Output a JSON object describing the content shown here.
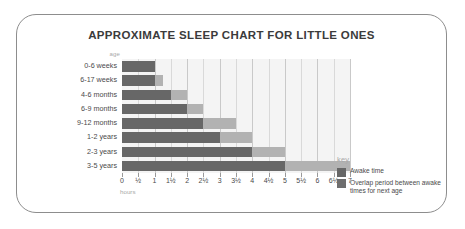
{
  "title": "APPROXIMATE SLEEP CHART FOR LITTLE ONES",
  "axis": {
    "y_title": "age",
    "x_title": "hours"
  },
  "legend": {
    "title": "key",
    "items": [
      {
        "label": "Awake time",
        "color": "#676767"
      },
      {
        "label": "Overlap period between awake times for next age",
        "color": "#6e6e6e"
      }
    ]
  },
  "chart_data": {
    "type": "bar",
    "orientation": "horizontal",
    "stacked": true,
    "title": "APPROXIMATE SLEEP CHART FOR LITTLE ONES",
    "xlabel": "hours",
    "ylabel": "age",
    "xlim": [
      0,
      7
    ],
    "grid": true,
    "legend_position": "right",
    "categories": [
      "0-6 weeks",
      "6-17 weeks",
      "4-6 months",
      "6-9 months",
      "9-12 months",
      "1-2 years",
      "2-3 years",
      "3-5 years"
    ],
    "tick_labels": [
      "0",
      "½",
      "1",
      "1½",
      "2",
      "2½",
      "3",
      "3½",
      "4",
      "4½",
      "5",
      "5½",
      "6",
      "6½",
      "7"
    ],
    "tick_values": [
      0,
      0.5,
      1,
      1.5,
      2,
      2.5,
      3,
      3.5,
      4,
      4.5,
      5,
      5.5,
      6,
      6.5,
      7
    ],
    "series": [
      {
        "name": "Awake time",
        "color": "#676767",
        "values": [
          1,
          1,
          1.5,
          2,
          2.5,
          3,
          4,
          5
        ]
      },
      {
        "name": "Overlap period between awake times for next age",
        "color": "#b2b2b2",
        "values": [
          0,
          0.25,
          0.5,
          0.5,
          1,
          1,
          1,
          2
        ]
      }
    ],
    "bars": [
      {
        "category": "0-6 weeks",
        "awake_end": 1,
        "overlap_end": 1
      },
      {
        "category": "6-17 weeks",
        "awake_end": 1,
        "overlap_end": 1.25
      },
      {
        "category": "4-6 months",
        "awake_end": 1.5,
        "overlap_end": 2
      },
      {
        "category": "6-9 months",
        "awake_end": 2,
        "overlap_end": 2.5
      },
      {
        "category": "9-12 months",
        "awake_end": 2.5,
        "overlap_end": 3.5
      },
      {
        "category": "1-2 years",
        "awake_end": 3,
        "overlap_end": 4
      },
      {
        "category": "2-3 years",
        "awake_end": 4,
        "overlap_end": 5
      },
      {
        "category": "3-5 years",
        "awake_end": 5,
        "overlap_end": 7
      }
    ]
  }
}
